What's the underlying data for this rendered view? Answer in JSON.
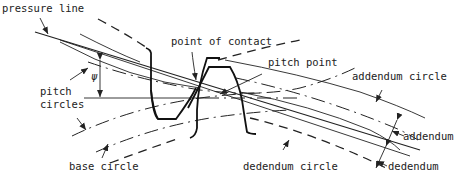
{
  "diagram": {
    "labels": {
      "pressure_line": "pressure line",
      "point_of_contact": "point of contact",
      "pitch_point": "pitch point",
      "addendum_circle": "addendum circle",
      "pitch_circles_1": "pitch",
      "pitch_circles_2": "circles",
      "psi": "ψ",
      "base_circle": "base circle",
      "dedendum_circle": "dedendum circle",
      "addendum": "addendum",
      "dedendum": "dedendum"
    },
    "colors": {
      "line": "#222222",
      "background": "#ffffff"
    }
  }
}
